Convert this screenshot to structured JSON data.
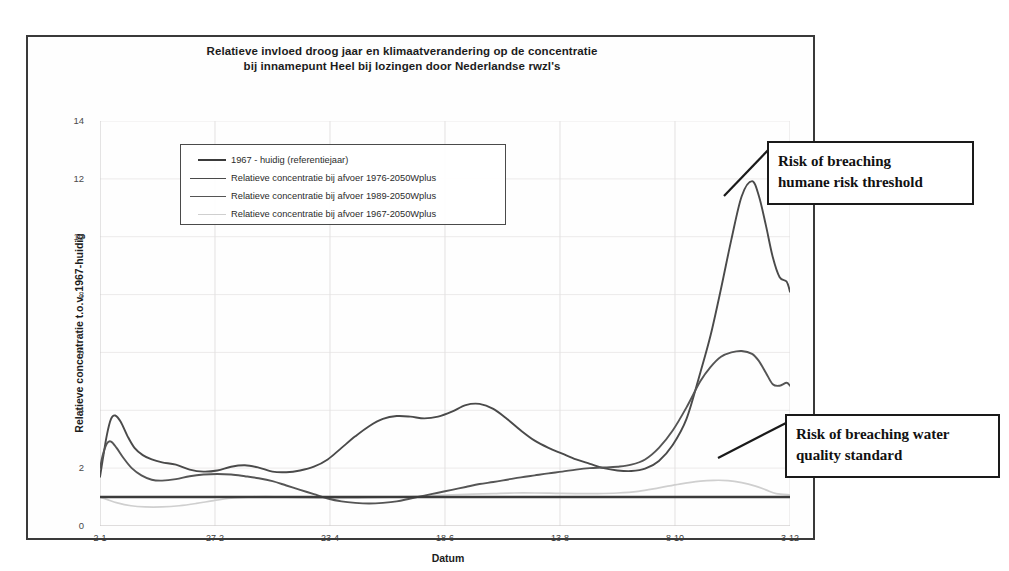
{
  "figure": {
    "title_line1": "Relatieve invloed droog jaar en klimaatverandering op de concentratie",
    "title_line2": "bij innamepunt Heel bij lozingen door Nederlandse rwzl's"
  },
  "annotations": [
    {
      "id": "humane",
      "line1": "Risk of breaching",
      "line2": "humane risk threshold"
    },
    {
      "id": "water",
      "line1": "Risk of breaching water",
      "line2": "quality standard"
    }
  ],
  "chart_data": {
    "type": "line",
    "title": "Relatieve invloed droog jaar en klimaatverandering op de concentratie bij innamepunt Heel bij lozingen door Nederlandse rwzl's",
    "xlabel": "Datum",
    "ylabel": "Relatieve concentratie t.o.v. 1967-huidig",
    "ylim": [
      0,
      14
    ],
    "yticks": [
      0,
      2,
      4,
      6,
      8,
      10,
      12,
      14
    ],
    "xtick_labels": [
      "2-1",
      "27-2",
      "23-4",
      "18-6",
      "13-8",
      "8-10",
      "3-12"
    ],
    "xtick_positions": [
      0.0,
      0.1667,
      0.3333,
      0.5,
      0.6667,
      0.8333,
      1.0
    ],
    "grid": "vertical-light",
    "legend_position": "upper-left-inside",
    "series": [
      {
        "name": "1967 - huidig (referentiejaar)",
        "color": "#3b3b3b",
        "width": 2.6,
        "x": [
          0.0,
          0.25,
          0.5,
          0.75,
          1.0
        ],
        "values": [
          1.0,
          1.0,
          1.0,
          1.0,
          1.0
        ]
      },
      {
        "name": "Relatieve concentratie bij afvoer 1976-2050Wplus",
        "color": "#4a4a4a",
        "width": 1.9,
        "x": [
          0.0,
          0.004,
          0.01,
          0.016,
          0.022,
          0.03,
          0.04,
          0.05,
          0.062,
          0.075,
          0.09,
          0.11,
          0.13,
          0.15,
          0.17,
          0.19,
          0.21,
          0.23,
          0.25,
          0.27,
          0.29,
          0.31,
          0.33,
          0.35,
          0.37,
          0.39,
          0.41,
          0.43,
          0.45,
          0.47,
          0.49,
          0.51,
          0.53,
          0.55,
          0.57,
          0.59,
          0.61,
          0.63,
          0.65,
          0.67,
          0.69,
          0.71,
          0.73,
          0.75,
          0.77,
          0.79,
          0.81,
          0.83,
          0.85,
          0.87,
          0.885,
          0.9,
          0.915,
          0.93,
          0.945,
          0.955,
          0.965,
          0.975,
          0.985,
          0.995,
          1.0
        ],
        "values": [
          1.7,
          2.3,
          3.15,
          3.7,
          3.82,
          3.6,
          3.1,
          2.7,
          2.45,
          2.3,
          2.2,
          2.12,
          1.95,
          1.88,
          1.92,
          2.05,
          2.1,
          2.02,
          1.88,
          1.86,
          1.92,
          2.05,
          2.3,
          2.7,
          3.1,
          3.45,
          3.7,
          3.8,
          3.78,
          3.72,
          3.78,
          3.95,
          4.18,
          4.22,
          4.05,
          3.7,
          3.3,
          2.95,
          2.7,
          2.5,
          2.3,
          2.15,
          2.0,
          1.92,
          1.9,
          1.98,
          2.25,
          2.8,
          3.7,
          5.3,
          6.6,
          8.2,
          9.9,
          11.4,
          11.92,
          11.4,
          10.4,
          9.3,
          8.6,
          8.45,
          8.1
        ]
      },
      {
        "name": "Relatieve concentratie bij afvoer 1989-2050Wplus",
        "color": "#555555",
        "width": 1.9,
        "x": [
          0.0,
          0.004,
          0.01,
          0.016,
          0.024,
          0.034,
          0.046,
          0.06,
          0.075,
          0.09,
          0.11,
          0.13,
          0.15,
          0.17,
          0.19,
          0.21,
          0.23,
          0.25,
          0.27,
          0.29,
          0.31,
          0.33,
          0.35,
          0.37,
          0.39,
          0.41,
          0.43,
          0.45,
          0.47,
          0.49,
          0.51,
          0.53,
          0.55,
          0.57,
          0.59,
          0.61,
          0.63,
          0.65,
          0.67,
          0.69,
          0.71,
          0.73,
          0.75,
          0.77,
          0.79,
          0.81,
          0.83,
          0.85,
          0.87,
          0.885,
          0.9,
          0.915,
          0.93,
          0.945,
          0.955,
          0.965,
          0.975,
          0.985,
          0.995,
          1.0
        ],
        "values": [
          2.0,
          2.45,
          2.85,
          2.92,
          2.7,
          2.35,
          2.0,
          1.75,
          1.6,
          1.57,
          1.62,
          1.72,
          1.78,
          1.8,
          1.78,
          1.72,
          1.65,
          1.55,
          1.4,
          1.25,
          1.1,
          0.95,
          0.85,
          0.8,
          0.78,
          0.8,
          0.85,
          0.95,
          1.05,
          1.15,
          1.25,
          1.35,
          1.45,
          1.52,
          1.6,
          1.68,
          1.75,
          1.82,
          1.88,
          1.95,
          2.0,
          2.02,
          2.05,
          2.12,
          2.3,
          2.7,
          3.3,
          4.1,
          5.0,
          5.5,
          5.85,
          6.0,
          6.05,
          5.95,
          5.7,
          5.3,
          4.9,
          4.85,
          4.95,
          4.85
        ]
      },
      {
        "name": "Relatieve concentratie bij afvoer 1967-2050Wplus",
        "color": "#cfcfcf",
        "width": 1.7,
        "x": [
          0.0,
          0.01,
          0.025,
          0.045,
          0.065,
          0.09,
          0.115,
          0.14,
          0.165,
          0.19,
          0.215,
          0.24,
          0.27,
          0.3,
          0.33,
          0.36,
          0.39,
          0.42,
          0.45,
          0.48,
          0.51,
          0.54,
          0.57,
          0.6,
          0.63,
          0.66,
          0.69,
          0.72,
          0.75,
          0.78,
          0.81,
          0.84,
          0.87,
          0.89,
          0.91,
          0.93,
          0.95,
          0.965,
          0.98,
          1.0
        ],
        "values": [
          1.0,
          0.92,
          0.8,
          0.7,
          0.66,
          0.66,
          0.7,
          0.78,
          0.88,
          0.96,
          1.0,
          1.02,
          1.0,
          0.98,
          0.96,
          0.96,
          0.98,
          1.0,
          1.02,
          1.05,
          1.08,
          1.1,
          1.12,
          1.14,
          1.14,
          1.13,
          1.12,
          1.12,
          1.14,
          1.2,
          1.32,
          1.45,
          1.55,
          1.58,
          1.57,
          1.5,
          1.38,
          1.25,
          1.12,
          1.08
        ]
      }
    ]
  }
}
